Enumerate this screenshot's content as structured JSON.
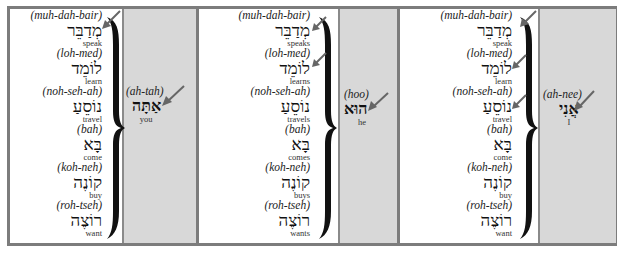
{
  "colors": {
    "frame_border": "#7c7c7c",
    "pronoun_column_bg": "#d8d8d8",
    "verb_column_bg": "#ffffff",
    "arrow": "#666666",
    "brace": "#111111"
  },
  "panels": [
    {
      "verbs": [
        {
          "translit": "(muh-dah-bair)",
          "hebrew": "מְדַבֵּר",
          "gloss": "speak"
        },
        {
          "translit": "(loh-med)",
          "hebrew": "לוֹמֵד",
          "gloss": "learn"
        },
        {
          "translit": "(noh-seh-ah)",
          "hebrew": "נוֹסֵעַ",
          "gloss": "travel"
        },
        {
          "translit": "(bah)",
          "hebrew": "בָּא",
          "gloss": "come"
        },
        {
          "translit": "(koh-neh)",
          "hebrew": "קוֹנֶה",
          "gloss": "buy"
        },
        {
          "translit": "(roh-tseh)",
          "hebrew": "רוֹצֶה",
          "gloss": "want"
        }
      ],
      "pronoun": {
        "translit": "(ah-tah)",
        "hebrew": "אַתָּה",
        "gloss": "you"
      },
      "verb_arrows": [
        0
      ]
    },
    {
      "verbs": [
        {
          "translit": "(muh-dah-bair)",
          "hebrew": "מְדַבֵּר",
          "gloss": "speaks"
        },
        {
          "translit": "(loh-med)",
          "hebrew": "לוֹמֵד",
          "gloss": "learns"
        },
        {
          "translit": "(noh-seh-ah)",
          "hebrew": "נוֹסֵעַ",
          "gloss": "travels"
        },
        {
          "translit": "(bah)",
          "hebrew": "בָּא",
          "gloss": "comes"
        },
        {
          "translit": "(koh-neh)",
          "hebrew": "קוֹנֶה",
          "gloss": "buys"
        },
        {
          "translit": "(roh-tseh)",
          "hebrew": "רוֹצֶה",
          "gloss": "wants"
        }
      ],
      "pronoun": {
        "translit": "(hoo)",
        "hebrew": "הוּא",
        "gloss": "he"
      },
      "verb_arrows": [
        0,
        1
      ]
    },
    {
      "verbs": [
        {
          "translit": "(muh-dah-bair)",
          "hebrew": "מְדַבֵּר",
          "gloss": "speak"
        },
        {
          "translit": "(loh-med)",
          "hebrew": "לוֹמֵד",
          "gloss": "learn"
        },
        {
          "translit": "(noh-seh-ah)",
          "hebrew": "נוֹסֵעַ",
          "gloss": "travel"
        },
        {
          "translit": "(bah)",
          "hebrew": "בָּא",
          "gloss": "come"
        },
        {
          "translit": "(koh-neh)",
          "hebrew": "קוֹנֶה",
          "gloss": "buy"
        },
        {
          "translit": "(roh-tseh)",
          "hebrew": "רוֹצֶה",
          "gloss": "want"
        }
      ],
      "pronoun": {
        "translit": "(ah-nee)",
        "hebrew": "אֲנִי",
        "gloss": "I"
      },
      "verb_arrows": [
        0,
        1,
        2
      ]
    }
  ]
}
